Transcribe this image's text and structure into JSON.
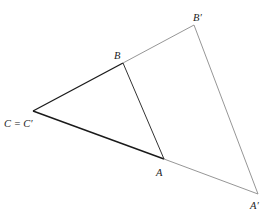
{
  "diagram": {
    "title": "",
    "points": {
      "C": {
        "x": 33,
        "y": 111
      },
      "B": {
        "x": 123,
        "y": 63
      },
      "A": {
        "x": 164,
        "y": 159
      },
      "B_prime": {
        "x": 194,
        "y": 25
      },
      "A_prime": {
        "x": 258,
        "y": 194
      }
    },
    "labels": {
      "C": "C = C′",
      "B": "B",
      "A": "A",
      "B_prime": "B′",
      "A_prime": "A′"
    },
    "colors": {
      "original_triangle": "#1a1a1a",
      "image_triangle": "#8a8a8a",
      "background": "#ffffff"
    }
  }
}
